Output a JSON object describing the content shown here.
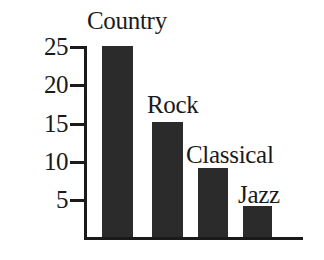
{
  "chart_data": {
    "type": "bar",
    "title": "",
    "subtitle": "",
    "xlabel": "",
    "ylabel": "",
    "categories": [
      "Country",
      "Rock",
      "Classical",
      "Jazz"
    ],
    "values": [
      25,
      15,
      9,
      4
    ],
    "series": [
      {
        "name": "Number of students",
        "values": [
          25,
          15,
          9,
          4
        ]
      }
    ],
    "ylim": [
      0,
      26
    ],
    "xlim": [
      0,
      4
    ],
    "y_ticks": [
      5,
      10,
      15,
      20,
      25
    ],
    "y_tick_labels": [
      "5",
      "10",
      "15",
      "20",
      "25"
    ],
    "x_tick_labels": [],
    "grid": false,
    "legend": null,
    "legend_position": "none",
    "annotations": [
      {
        "text": "Country",
        "for": "Country",
        "placement": "above-bar"
      },
      {
        "text": "Rock",
        "for": "Rock",
        "placement": "above-bar"
      },
      {
        "text": "Classical",
        "for": "Classical",
        "placement": "above-bar"
      },
      {
        "text": "Jazz",
        "for": "Jazz",
        "placement": "above-bar"
      }
    ],
    "bar_color": "#2b2b2b",
    "axis_color": "#1a1a1a",
    "background_color": "#ffffff"
  },
  "axis": {
    "ticks": [
      {
        "label": "25",
        "value": 25
      },
      {
        "label": "20",
        "value": 20
      },
      {
        "label": "15",
        "value": 15
      },
      {
        "label": "10",
        "value": 10
      },
      {
        "label": "5",
        "value": 5
      }
    ]
  },
  "bars": [
    {
      "label": "Country",
      "value": 25
    },
    {
      "label": "Rock",
      "value": 15
    },
    {
      "label": "Classical",
      "value": 9
    },
    {
      "label": "Jazz",
      "value": 4
    }
  ]
}
